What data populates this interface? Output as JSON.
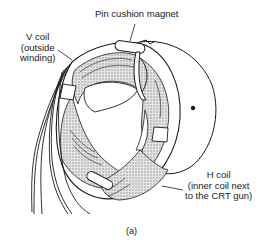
{
  "figure": {
    "caption": "(a)",
    "callouts": {
      "pin_cushion": {
        "lines": [
          "Pin cushion magnet"
        ]
      },
      "v_coil": {
        "lines": [
          "V coil",
          "(outside",
          "winding)"
        ]
      },
      "h_coil": {
        "lines": [
          "H coil",
          "(inner coil next",
          "to the CRT gun)"
        ]
      }
    }
  },
  "colors": {
    "ink": "#1a1a1a",
    "shading": "#bdbdbd",
    "background": "#ffffff"
  }
}
